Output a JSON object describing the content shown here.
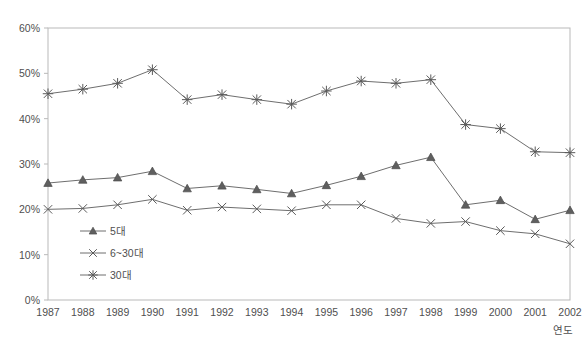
{
  "chart_data": {
    "type": "line",
    "title": "",
    "subtitle": "",
    "xlabel": "연도",
    "ylabel": "",
    "x": [
      "1987",
      "1988",
      "1989",
      "1990",
      "1991",
      "1992",
      "1993",
      "1994",
      "1995",
      "1996",
      "1997",
      "1998",
      "1999",
      "2000",
      "2001",
      "2002"
    ],
    "categories": [
      "1987",
      "1988",
      "1989",
      "1990",
      "1991",
      "1992",
      "1993",
      "1994",
      "1995",
      "1996",
      "1997",
      "1998",
      "1999",
      "2000",
      "2001",
      "2002"
    ],
    "ylim": [
      0,
      60
    ],
    "ytick_labels": [
      "0%",
      "10%",
      "20%",
      "30%",
      "40%",
      "50%",
      "60%"
    ],
    "ytick_values": [
      0,
      10,
      20,
      30,
      40,
      50,
      60
    ],
    "grid": false,
    "legend_position": "inside-bottom-left",
    "series": [
      {
        "name": "5대",
        "marker": "triangle",
        "color": "#6e6e6e",
        "values": [
          25.8,
          26.5,
          27.0,
          28.4,
          24.6,
          25.2,
          24.4,
          23.5,
          25.3,
          27.3,
          29.7,
          31.5,
          21.0,
          22.0,
          17.8,
          19.8
        ]
      },
      {
        "name": "6~30대",
        "marker": "cross",
        "color": "#6e6e6e",
        "values": [
          20.0,
          20.2,
          21.0,
          22.2,
          19.8,
          20.5,
          20.1,
          19.7,
          21.0,
          21.0,
          18.0,
          16.9,
          17.3,
          15.3,
          14.6,
          12.4
        ]
      },
      {
        "name": "30대",
        "marker": "asterisk",
        "color": "#6e6e6e",
        "values": [
          45.5,
          46.5,
          47.8,
          50.8,
          44.2,
          45.3,
          44.2,
          43.2,
          46.1,
          48.3,
          47.8,
          48.6,
          38.7,
          37.8,
          32.7,
          32.5
        ]
      }
    ]
  },
  "legend": {
    "items": [
      {
        "label": "5대",
        "marker": "triangle"
      },
      {
        "label": "6~30대",
        "marker": "cross"
      },
      {
        "label": "30대",
        "marker": "asterisk"
      }
    ]
  },
  "axes": {
    "x_axis_title": "연도",
    "y_tick_0": "0%",
    "y_tick_1": "10%",
    "y_tick_2": "20%",
    "y_tick_3": "30%",
    "y_tick_4": "40%",
    "y_tick_5": "50%",
    "y_tick_6": "60%"
  },
  "colors": {
    "line": "#6e6e6e",
    "frame": "#b9b9b9",
    "text": "#4f4f4f",
    "background": "#ffffff"
  }
}
